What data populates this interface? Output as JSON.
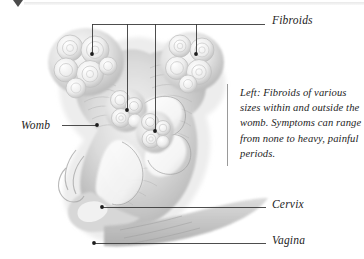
{
  "figure": {
    "corner_marker_icon": "triangle-down-icon"
  },
  "labels": {
    "fibroids": "Fibroids",
    "womb": "Womb",
    "cervix": "Cervix",
    "vagina": "Vagina"
  },
  "caption": {
    "text": "Left: Fibroids of various sizes within and outside the womb. Symptoms can range from none to heavy, painful periods."
  },
  "colors": {
    "leader_line": "#3a3a3a",
    "label_text": "#1d1d1d",
    "caption_rule": "#9a9a9a",
    "tissue_light": "#e9e9e9",
    "tissue_mid": "#c9c9c9",
    "tissue_dark": "#9a9a9a",
    "cavity": "#ffffff",
    "background": "#ffffff"
  },
  "leaders": {
    "fibroids_bus_y": 24,
    "fibroids_points": [
      {
        "name": "upper-left-fibroid",
        "x": 92,
        "y": 54
      },
      {
        "name": "inner-upper-fibroid",
        "x": 127,
        "y": 110
      },
      {
        "name": "inner-lower-fibroid",
        "x": 155,
        "y": 131
      },
      {
        "name": "upper-right-fibroid",
        "x": 196,
        "y": 54
      }
    ],
    "womb_point": {
      "x": 97,
      "y": 125
    },
    "cervix_point": {
      "x": 102,
      "y": 207
    },
    "vagina_point": {
      "x": 94,
      "y": 243
    }
  }
}
